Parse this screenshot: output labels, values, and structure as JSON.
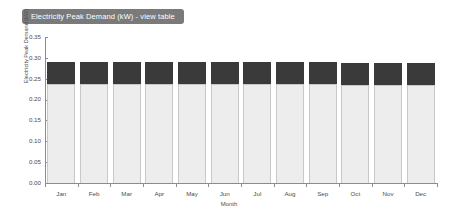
{
  "title": {
    "badge_label": "Electricity Peak Demand (kW) - view table"
  },
  "colors": {
    "badge_background": "#7a7a7a",
    "badge_text": "#ffffff",
    "segment_dark": "#3a3a3a",
    "segment_light": "#ededed",
    "axis": "#8c8c8c",
    "page_background": "#ffffff"
  },
  "chart_data": {
    "type": "bar",
    "title": "Electricity Peak Demand (kW) - view table",
    "xlabel": "Month",
    "ylabel": "Electricity Peak Demand (kW)",
    "ylim": [
      0.0,
      0.35
    ],
    "ytick_labels": [
      "0.35",
      "0.30",
      "0.25",
      "0.20",
      "0.15",
      "0.10",
      "0.05",
      "0.00"
    ],
    "ytick_values": [
      0.35,
      0.3,
      0.25,
      0.2,
      0.15,
      0.1,
      0.05,
      0.0
    ],
    "grid": false,
    "legend": false,
    "stacked": true,
    "categories": [
      "Jan",
      "Feb",
      "Mar",
      "Apr",
      "May",
      "Jun",
      "Jul",
      "Aug",
      "Sep",
      "Oct",
      "Nov",
      "Dec"
    ],
    "series": [
      {
        "name": "base",
        "color": "#ededed",
        "values": [
          0.238,
          0.238,
          0.238,
          0.238,
          0.238,
          0.237,
          0.237,
          0.237,
          0.237,
          0.236,
          0.236,
          0.236
        ]
      },
      {
        "name": "peak",
        "color": "#3a3a3a",
        "values": [
          0.052,
          0.052,
          0.052,
          0.052,
          0.052,
          0.052,
          0.052,
          0.052,
          0.052,
          0.052,
          0.052,
          0.052
        ]
      }
    ],
    "totals": [
      0.29,
      0.29,
      0.29,
      0.29,
      0.29,
      0.289,
      0.289,
      0.289,
      0.289,
      0.288,
      0.288,
      0.288
    ]
  }
}
